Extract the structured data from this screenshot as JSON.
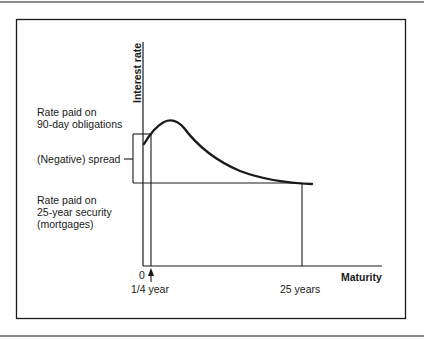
{
  "diagram": {
    "type": "yield-curve-illustration",
    "axes": {
      "y_label": "Interest rate",
      "x_label": "Maturity",
      "origin_label": "0"
    },
    "x_markers": [
      {
        "label": "1/4 year"
      },
      {
        "label": "25 years"
      }
    ],
    "annotations": {
      "short_rate_line1": "Rate paid on",
      "short_rate_line2": "90-day obligations",
      "spread": "(Negative) spread",
      "long_rate_line1": "Rate paid on",
      "long_rate_line2": "25-year security",
      "long_rate_line3": "(mortgages)"
    },
    "curve": {
      "description": "Humped yield curve: rises from 90-day rate, peaks shortly after, declines toward 25-year rate",
      "color": "#1a1a1a"
    }
  }
}
